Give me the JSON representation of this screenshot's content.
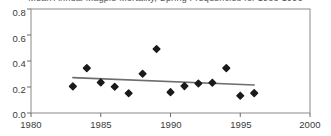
{
  "chart_data": {
    "type": "scatter",
    "title": "Mean Annual Magpie Mortality, Spring Frequencies for 1983-1996",
    "xlabel": "",
    "ylabel": "",
    "xlim": [
      1980,
      2000
    ],
    "ylim": [
      0.0,
      0.8
    ],
    "grid": false,
    "legend": "none",
    "x_ticks": [
      "1980",
      "1985",
      "1990",
      "1995",
      "2000"
    ],
    "x_tick_values": [
      1980,
      1985,
      1990,
      1995,
      2000
    ],
    "y_ticks": [
      "0.0",
      "0.2",
      "0.4",
      "0.6",
      "0.8"
    ],
    "y_tick_values": [
      0.0,
      0.2,
      0.4,
      0.6,
      0.8
    ],
    "series": [
      {
        "name": "observations",
        "marker": "diamond",
        "color": "#1a1a1a",
        "x": [
          1983,
          1984,
          1985,
          1986,
          1987,
          1988,
          1989,
          1990,
          1991,
          1992,
          1993,
          1994,
          1995,
          1996
        ],
        "y": [
          0.205,
          0.345,
          0.235,
          0.202,
          0.152,
          0.302,
          0.492,
          0.16,
          0.207,
          0.227,
          0.233,
          0.345,
          0.133,
          0.153
        ]
      },
      {
        "name": "trend-line",
        "marker": "none",
        "color": "#6e6e6e",
        "x": [
          1983,
          1996
        ],
        "y": [
          0.272,
          0.215
        ]
      }
    ]
  },
  "axes": {
    "frame_color": "#8a8a8a",
    "tick_color": "#6a6a6a"
  }
}
